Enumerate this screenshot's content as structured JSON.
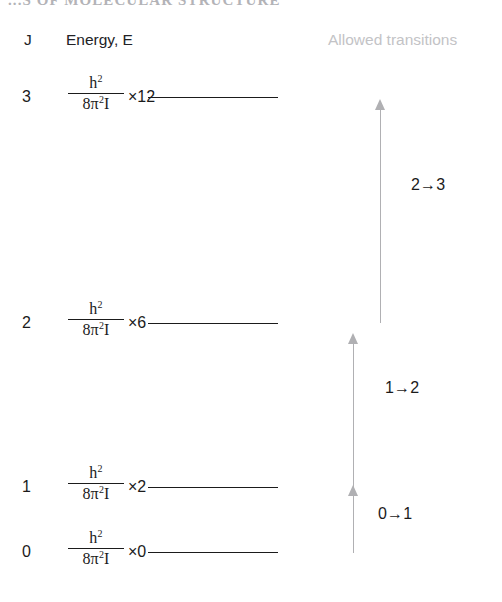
{
  "running_head": "...S OF MOLECULAR STRUCTURE",
  "headers": {
    "quantum_number": "J",
    "energy": "Energy, E",
    "allowed_transitions": "Allowed transitions"
  },
  "formula": {
    "numerator": "h",
    "numerator_exponent": "2",
    "denominator_coefficient": "8",
    "denominator_symbol": "π",
    "denominator_exponent": "2",
    "denominator_inertia": "I"
  },
  "levels": [
    {
      "j": "3",
      "multiplier": "×12",
      "line_y": 97,
      "row_top": 75
    },
    {
      "j": "2",
      "multiplier": "×6",
      "line_y": 323,
      "row_top": 301
    },
    {
      "j": "1",
      "multiplier": "×2",
      "line_y": 487,
      "row_top": 465
    },
    {
      "j": "0",
      "multiplier": "×0",
      "line_y": 552,
      "row_top": 530
    }
  ],
  "level_line": {
    "x_start": 148,
    "x_end": 278
  },
  "transitions": [
    {
      "label": "2→3",
      "arrow_x": 375,
      "arrow_top": 99,
      "arrow_bottom": 323,
      "label_x": 411,
      "label_y": 176
    },
    {
      "label": "1→2",
      "arrow_x": 348,
      "arrow_top": 333,
      "arrow_bottom": 487,
      "label_x": 385,
      "label_y": 379
    },
    {
      "label": "0→1",
      "arrow_x": 348,
      "arrow_top": 485,
      "arrow_bottom": 553,
      "label_x": 378,
      "label_y": 505
    }
  ],
  "colors": {
    "text": "#1b1b1b",
    "muted_text": "#c3c3c6",
    "arrow": "#b0b0b3",
    "background": "#ffffff"
  }
}
